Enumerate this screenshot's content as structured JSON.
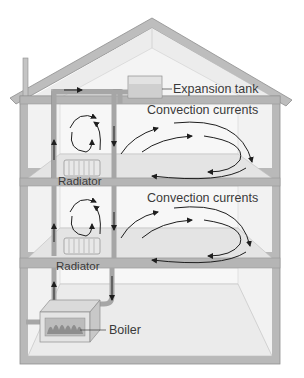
{
  "diagram": {
    "labels": {
      "expansion_tank": "Expansion tank",
      "convection_upper": "Convection currents",
      "convection_lower": "Convection currents",
      "radiator_upper": "Radiator",
      "radiator_lower": "Radiator",
      "boiler": "Boiler"
    },
    "colors": {
      "wall": "#b9b9b9",
      "wall_dark": "#9a9a9a",
      "interior": "#f1f1f1",
      "floor": "#e6e6e6",
      "pipe": "#a8a8a8",
      "arrow": "#1e1e1e",
      "text": "#3a3a3a"
    }
  }
}
